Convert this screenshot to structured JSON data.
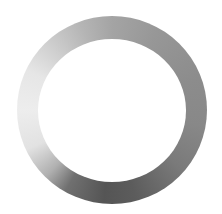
{
  "image": {
    "subject": "metal ring washer",
    "background_color": "#ffffff",
    "ring": {
      "shape": "annulus",
      "outer_bounds": {
        "left": 17,
        "top": 16,
        "width": 190,
        "height": 188
      },
      "inner_bounds": {
        "left": 38,
        "top": 39,
        "width": 148,
        "height": 143
      },
      "shading": {
        "left": "#ededed",
        "top": "#a4a4a4",
        "right": "#888888",
        "bottom": "#555555"
      }
    }
  }
}
